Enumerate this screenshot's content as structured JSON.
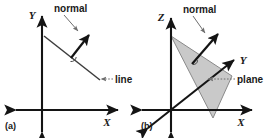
{
  "figure": {
    "background_color": "#ffffff",
    "ink_color": "#141414",
    "plane_fill_color": "#c9c9c9",
    "plane_stroke_color": "#8a8a8a",
    "leader_color": "#6e6e6e",
    "geometry_color": "#3c3c3c"
  },
  "panel_a": {
    "caption": "(a)",
    "axes": [
      {
        "name": "x-axis",
        "label": "X"
      },
      {
        "name": "y-axis",
        "label": "Y"
      }
    ],
    "annotations": [
      {
        "name": "normal-label",
        "label": "normal"
      },
      {
        "name": "line-label",
        "label": "line"
      }
    ],
    "elements": [
      {
        "name": "line-segment",
        "kind": "line"
      },
      {
        "name": "normal-vector",
        "kind": "arrow"
      },
      {
        "name": "right-angle-marker",
        "kind": "angle"
      }
    ]
  },
  "panel_b": {
    "caption": "(b)",
    "axes": [
      {
        "name": "x-axis",
        "label": "X"
      },
      {
        "name": "y-axis",
        "label": "Y"
      },
      {
        "name": "z-axis",
        "label": "Z"
      }
    ],
    "annotations": [
      {
        "name": "normal-label",
        "label": "normal"
      },
      {
        "name": "plane-label",
        "label": "plane"
      }
    ],
    "elements": [
      {
        "name": "plane-polygon",
        "kind": "polygon"
      },
      {
        "name": "normal-vector",
        "kind": "arrow"
      },
      {
        "name": "right-angle-marker",
        "kind": "angle"
      }
    ]
  }
}
